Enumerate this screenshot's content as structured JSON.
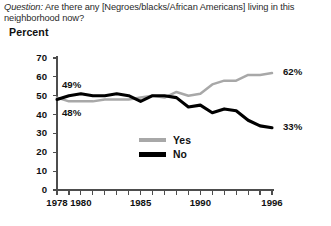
{
  "question": {
    "label": "Question:",
    "text": "Are there any [Negroes/blacks/African Americans] living in this neighborhood now?"
  },
  "axis_unit_label": "Percent",
  "legend": {
    "yes_label": "Yes",
    "no_label": "No"
  },
  "annotations": {
    "yes_start": "49%",
    "no_start": "48%",
    "yes_end": "62%",
    "no_end": "33%"
  },
  "colors": {
    "yes_line": "#a8a8a8",
    "no_line": "#000000",
    "axis": "#4d4d4d",
    "text": "#111111"
  },
  "chart_data": {
    "type": "line",
    "title": "Are there any [Negroes/blacks/African Americans] living in this neighborhood now?",
    "xlabel": "",
    "ylabel": "Percent",
    "ylim": [
      0,
      70
    ],
    "xlim": [
      1978,
      1996
    ],
    "yticks": [
      0,
      10,
      20,
      30,
      40,
      50,
      60,
      70
    ],
    "ytick_labels": [
      "0",
      "10",
      "20",
      "30",
      "40",
      "50",
      "60",
      "70"
    ],
    "xticks": [
      1978,
      1979,
      1980,
      1981,
      1982,
      1983,
      1984,
      1985,
      1986,
      1987,
      1988,
      1989,
      1990,
      1991,
      1992,
      1993,
      1994,
      1995,
      1996
    ],
    "xtick_labels_shown": [
      "1978",
      "1980",
      "1985",
      "1990",
      "1996"
    ],
    "xtick_labels_shown_at": [
      1978,
      1980,
      1985,
      1990,
      1996
    ],
    "grid": false,
    "legend_position": "center",
    "x": [
      1978,
      1979,
      1980,
      1981,
      1982,
      1983,
      1984,
      1985,
      1986,
      1987,
      1988,
      1989,
      1990,
      1991,
      1992,
      1993,
      1994,
      1995,
      1996
    ],
    "series": [
      {
        "name": "Yes",
        "color": "#a8a8a8",
        "values": [
          49,
          47,
          47,
          47,
          48,
          48,
          48,
          49,
          50,
          49,
          52,
          50,
          51,
          56,
          58,
          58,
          61,
          61,
          62
        ]
      },
      {
        "name": "No",
        "color": "#000000",
        "values": [
          48,
          50,
          51,
          50,
          50,
          51,
          50,
          47,
          50,
          50,
          49,
          44,
          45,
          41,
          43,
          42,
          37,
          34,
          33
        ]
      }
    ],
    "annotations": [
      {
        "text": "49%",
        "series": "Yes",
        "x": 1978,
        "position": "left-above"
      },
      {
        "text": "48%",
        "series": "No",
        "x": 1978,
        "position": "left-below"
      },
      {
        "text": "62%",
        "series": "Yes",
        "x": 1996,
        "position": "right"
      },
      {
        "text": "33%",
        "series": "No",
        "x": 1996,
        "position": "right"
      }
    ]
  }
}
